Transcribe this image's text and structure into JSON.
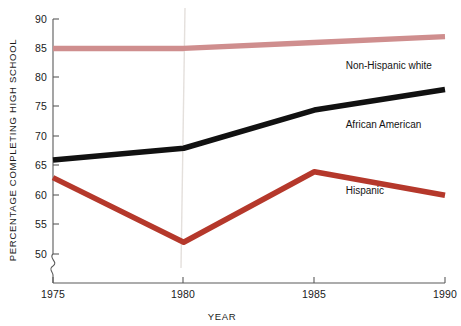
{
  "chart_data": {
    "type": "line",
    "title": "",
    "xlabel": "YEAR",
    "ylabel": "PERCENTAGE COMPLETING HIGH SCHOOL",
    "x": [
      1975,
      1980,
      1985,
      1990
    ],
    "xtick_labels": [
      "1975",
      "1980",
      "1985",
      "1990"
    ],
    "ytick_labels": [
      "50",
      "55",
      "60",
      "65",
      "70",
      "75",
      "80",
      "85",
      "90"
    ],
    "yticks": [
      50,
      55,
      60,
      65,
      70,
      75,
      80,
      85,
      90
    ],
    "ylim": [
      50,
      90
    ],
    "xlim": [
      1975,
      1990
    ],
    "grid": false,
    "legend_position": "inline-right-of-series",
    "axis_break": true,
    "axis_break_note": "squiggle break on y-axis below 50",
    "series": [
      {
        "name": "Non-Hispanic white",
        "color": "#cf8e8e",
        "values": [
          85,
          85,
          86,
          87
        ],
        "label_x": 1986.2,
        "label_y": 81.5
      },
      {
        "name": "African American",
        "color": "#111111",
        "values": [
          66,
          68,
          74.5,
          78
        ],
        "label_x": 1986.2,
        "label_y": 71.5
      },
      {
        "name": "Hispanic",
        "color": "#b5382b",
        "values": [
          63,
          52,
          64,
          60
        ],
        "label_x": 1986.2,
        "label_y": 60.2
      }
    ]
  },
  "axes": {
    "y_title": "PERCENTAGE COMPLETING HIGH SCHOOL",
    "x_title": "YEAR"
  },
  "labels": {
    "y_90": "90",
    "y_85": "85",
    "y_80": "80",
    "y_75": "75",
    "y_70": "70",
    "y_65": "65",
    "y_60": "60",
    "y_55": "55",
    "y_50": "50",
    "x_1975": "1975",
    "x_1980": "1980",
    "x_1985": "1985",
    "x_1990": "1990",
    "series_white": "Non-Hispanic white",
    "series_black": "African American",
    "series_hispanic": "Hispanic"
  }
}
